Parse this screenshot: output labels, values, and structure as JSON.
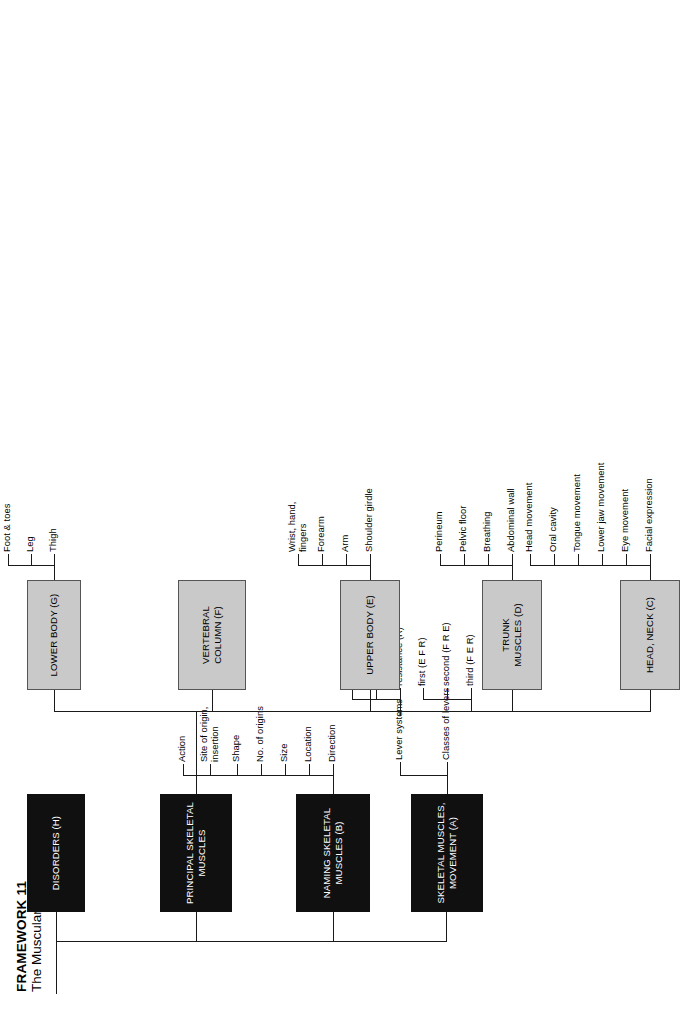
{
  "document": {
    "title_main": "FRAMEWORK 11",
    "title_sub": "The Muscular Systems"
  },
  "colors": {
    "dark_box": "#101010",
    "dark_box_text": "#ffffff",
    "gray_box": "#c9c9c9",
    "gray_box_border": "#555555",
    "line": "#1a1a1a",
    "page": "#ffffff"
  },
  "nodes": {
    "a": {
      "label": "SKELETAL MUSCLES, MOVEMENT (A)",
      "line1": "SKELETAL MUSCLES,",
      "line2": "MOVEMENT (A)",
      "style": "dark"
    },
    "b": {
      "label": "NAMING SKELETAL MUSCLES (B)",
      "line1": "NAMING SKELETAL",
      "line2": "MUSCLES (B)",
      "style": "dark"
    },
    "principal": {
      "label": "PRINCIPAL SKELETAL MUSCLES",
      "line1": "PRINCIPAL SKELETAL",
      "line2": "MUSCLES",
      "style": "dark"
    },
    "h": {
      "label": "DISORDERS (H)",
      "line1": "DISORDERS (H)",
      "line2": "",
      "style": "dark"
    },
    "c": {
      "label": "HEAD, NECK (C)",
      "line1": "HEAD, NECK (C)",
      "line2": "",
      "style": "gray"
    },
    "d": {
      "label": "TRUNK MUSCLES (D)",
      "line1": "TRUNK",
      "line2": "MUSCLES (D)",
      "style": "gray"
    },
    "e": {
      "label": "UPPER BODY (E)",
      "line1": "UPPER BODY (E)",
      "line2": "",
      "style": "gray"
    },
    "f": {
      "label": "VERTEBRAL COLUMN (F)",
      "line1": "VERTEBRAL",
      "line2": "COLUMN (F)",
      "style": "gray"
    },
    "g": {
      "label": "LOWER BODY (G)",
      "line1": "LOWER BODY (G)",
      "line2": "",
      "style": "gray"
    }
  },
  "branches": {
    "a_children": [
      {
        "label": "Lever systems"
      },
      {
        "label": "Classes of levers"
      }
    ],
    "a_lever_systems_children": [
      {
        "label": "fulcrum (F)"
      },
      {
        "label": "effort (E)"
      },
      {
        "label": "resistance (R)"
      }
    ],
    "a_classes_children": [
      {
        "label": "first (E F R)"
      },
      {
        "label": "second (F R E)"
      },
      {
        "label": "third (F E R)"
      }
    ],
    "b_children": [
      {
        "label": "Direction"
      },
      {
        "label": "Location"
      },
      {
        "label": "Size"
      },
      {
        "label": "No. of origins"
      },
      {
        "label": "Shape"
      },
      {
        "label": "Site of origin, insertion"
      },
      {
        "label": "Action"
      }
    ],
    "c_children": [
      {
        "label": "Facial expression"
      },
      {
        "label": "Eye movement"
      },
      {
        "label": "Lower jaw movement"
      },
      {
        "label": "Tongue movement"
      },
      {
        "label": "Oral cavity"
      },
      {
        "label": "Head  movement"
      }
    ],
    "d_children": [
      {
        "label": "Abdominal wall"
      },
      {
        "label": "Breathing"
      },
      {
        "label": "Pelvic floor"
      },
      {
        "label": "Perineum"
      }
    ],
    "e_children": [
      {
        "label": "Shoulder girdle"
      },
      {
        "label": "Arm"
      },
      {
        "label": "Forearm"
      },
      {
        "label": "Wrist, hand, fingers"
      }
    ],
    "f_children": [],
    "g_children": [
      {
        "label": "Thigh"
      },
      {
        "label": "Leg"
      },
      {
        "label": "Foot & toes"
      }
    ]
  }
}
